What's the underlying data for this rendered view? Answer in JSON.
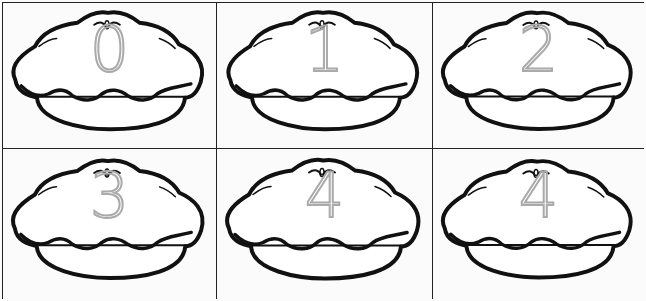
{
  "worksheet": {
    "cells": [
      {
        "number": "0"
      },
      {
        "number": "1"
      },
      {
        "number": "2"
      },
      {
        "number": "3"
      },
      {
        "number": "4"
      },
      {
        "number": "4"
      }
    ],
    "colors": {
      "outline": "#111111",
      "trace": "#aaaaaa",
      "grid": "#222222"
    }
  }
}
